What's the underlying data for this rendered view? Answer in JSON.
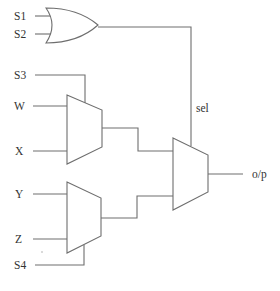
{
  "diagram": {
    "type": "digital-logic-circuit",
    "colors": {
      "stroke": "#6e6e6e",
      "text": "#333333",
      "background": "#ffffff"
    },
    "inputs": [
      {
        "id": "s1",
        "label": "S1"
      },
      {
        "id": "s2",
        "label": "S2"
      },
      {
        "id": "s3",
        "label": "S3"
      },
      {
        "id": "w",
        "label": "W"
      },
      {
        "id": "x",
        "label": "X"
      },
      {
        "id": "y",
        "label": "Y"
      },
      {
        "id": "z",
        "label": "Z"
      },
      {
        "id": "s4",
        "label": "S4"
      }
    ],
    "gates": [
      {
        "id": "or1",
        "kind": "OR",
        "inputs": [
          "S1",
          "S2"
        ],
        "output": "sel"
      },
      {
        "id": "mux1",
        "kind": "MUX",
        "inputs": [
          "W",
          "X"
        ],
        "select": "S3"
      },
      {
        "id": "mux2",
        "kind": "MUX",
        "inputs": [
          "Y",
          "Z"
        ],
        "select": "S4"
      },
      {
        "id": "mux3",
        "kind": "MUX",
        "inputs": [
          "mux1",
          "mux2"
        ],
        "select": "sel",
        "output": "o/p"
      }
    ],
    "signal_label": "sel",
    "output_label": "o/p"
  }
}
